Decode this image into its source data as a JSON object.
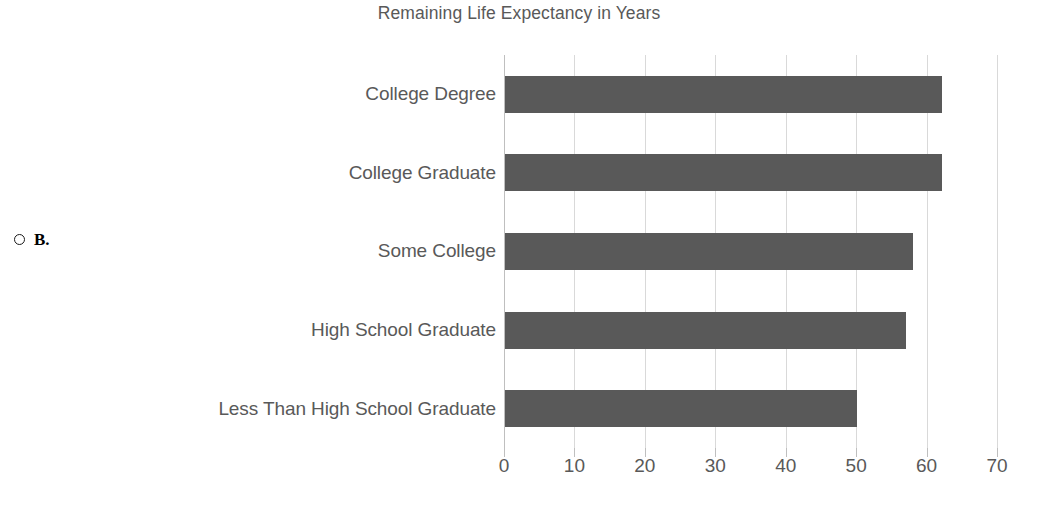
{
  "question": {
    "radio_icon": "radio-unselected-icon",
    "option_letter": "B."
  },
  "chart_data": {
    "type": "bar",
    "orientation": "horizontal",
    "title": "Remaining Life Expectancy in Years",
    "xlabel": "",
    "ylabel": "",
    "categories": [
      "College Degree",
      "College Graduate",
      "Some College",
      "High School Graduate",
      "Less Than High School Graduate"
    ],
    "values": [
      62,
      62,
      58,
      57,
      50
    ],
    "xlim": [
      0,
      70
    ],
    "xticks": [
      0,
      10,
      20,
      30,
      40,
      50,
      60,
      70
    ],
    "xtick_labels": [
      "0",
      "10",
      "20",
      "30",
      "40",
      "50",
      "60",
      "70"
    ],
    "grid": "vertical",
    "legend": "none",
    "bar_color": "#595959",
    "gridline_color": "#d9d9d9",
    "text_color": "#595959"
  }
}
